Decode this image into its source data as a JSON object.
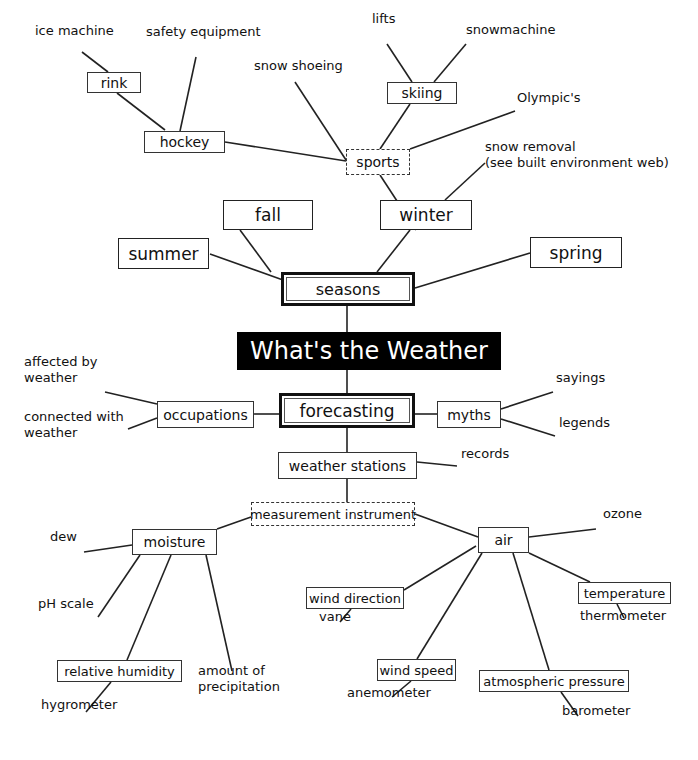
{
  "diagram": {
    "title": "What's the Weather",
    "colors": {
      "line": "#222222",
      "title_bg": "#000000",
      "title_fg": "#ffffff",
      "background": "#ffffff"
    },
    "nodes": [
      {
        "id": "title",
        "text": "What's the Weather",
        "style": "title",
        "x": 237,
        "y": 332,
        "w": 264,
        "h": 38,
        "fs": 24
      },
      {
        "id": "seasons",
        "text": "seasons",
        "style": "double-thick",
        "x": 281,
        "y": 272,
        "w": 134,
        "h": 34,
        "fs": 16
      },
      {
        "id": "forecasting",
        "text": "forecasting",
        "style": "double-thick",
        "x": 279,
        "y": 393,
        "w": 136,
        "h": 35,
        "fs": 17
      },
      {
        "id": "summer",
        "text": "summer",
        "style": "box-big",
        "x": 118,
        "y": 238,
        "w": 91,
        "h": 31,
        "fs": 17
      },
      {
        "id": "fall",
        "text": "fall",
        "style": "box-big",
        "x": 223,
        "y": 200,
        "w": 90,
        "h": 30,
        "fs": 17
      },
      {
        "id": "winter",
        "text": "winter",
        "style": "box-big",
        "x": 380,
        "y": 200,
        "w": 92,
        "h": 30,
        "fs": 17
      },
      {
        "id": "spring",
        "text": "spring",
        "style": "box-big",
        "x": 530,
        "y": 237,
        "w": 92,
        "h": 31,
        "fs": 17
      },
      {
        "id": "sports",
        "text": "sports",
        "style": "dashed",
        "x": 346,
        "y": 149,
        "w": 64,
        "h": 26,
        "fs": 14
      },
      {
        "id": "skiing",
        "text": "skiing",
        "style": "box",
        "x": 387,
        "y": 82,
        "w": 70,
        "h": 22,
        "fs": 14
      },
      {
        "id": "hockey",
        "text": "hockey",
        "style": "box",
        "x": 144,
        "y": 131,
        "w": 81,
        "h": 22,
        "fs": 14
      },
      {
        "id": "rink",
        "text": "rink",
        "style": "box",
        "x": 87,
        "y": 72,
        "w": 54,
        "h": 21,
        "fs": 14
      },
      {
        "id": "occupations",
        "text": "occupations",
        "style": "box",
        "x": 157,
        "y": 401,
        "w": 97,
        "h": 27,
        "fs": 14
      },
      {
        "id": "myths",
        "text": "myths",
        "style": "box",
        "x": 437,
        "y": 401,
        "w": 64,
        "h": 27,
        "fs": 14
      },
      {
        "id": "weather_stations",
        "text": "weather stations",
        "style": "box",
        "x": 278,
        "y": 452,
        "w": 139,
        "h": 27,
        "fs": 14
      },
      {
        "id": "measurement",
        "text": "measurement instrument",
        "style": "dashed",
        "x": 251,
        "y": 502,
        "w": 164,
        "h": 24,
        "fs": 13
      },
      {
        "id": "moisture",
        "text": "moisture",
        "style": "box",
        "x": 132,
        "y": 529,
        "w": 85,
        "h": 26,
        "fs": 14
      },
      {
        "id": "air",
        "text": "air",
        "style": "box",
        "x": 478,
        "y": 527,
        "w": 51,
        "h": 26,
        "fs": 14
      },
      {
        "id": "wind_direction",
        "text": "wind direction",
        "style": "box",
        "x": 306,
        "y": 587,
        "w": 98,
        "h": 22,
        "fs": 13
      },
      {
        "id": "temperature",
        "text": "temperature",
        "style": "box",
        "x": 578,
        "y": 582,
        "w": 93,
        "h": 22,
        "fs": 13
      },
      {
        "id": "relative_humidity",
        "text": "relative humidity",
        "style": "box",
        "x": 57,
        "y": 660,
        "w": 125,
        "h": 22,
        "fs": 13
      },
      {
        "id": "wind_speed",
        "text": "wind speed",
        "style": "box",
        "x": 377,
        "y": 659,
        "w": 79,
        "h": 22,
        "fs": 13
      },
      {
        "id": "atmospheric_pressure",
        "text": "atmospheric pressure",
        "style": "box",
        "x": 479,
        "y": 670,
        "w": 150,
        "h": 22,
        "fs": 13
      }
    ],
    "labels": [
      {
        "id": "ice_machine",
        "text": "ice machine",
        "x": 35,
        "y": 36,
        "fs": 13
      },
      {
        "id": "safety_equipment",
        "text": "safety equipment",
        "x": 146,
        "y": 37,
        "fs": 13
      },
      {
        "id": "lifts",
        "text": "lifts",
        "x": 372,
        "y": 24,
        "fs": 13
      },
      {
        "id": "snowmachine",
        "text": "snowmachine",
        "x": 466,
        "y": 35,
        "fs": 13
      },
      {
        "id": "snow_shoeing",
        "text": "snow shoeing",
        "x": 254,
        "y": 71,
        "fs": 13
      },
      {
        "id": "olympics",
        "text": "Olympic's",
        "x": 517,
        "y": 103,
        "fs": 13
      },
      {
        "id": "snow_removal",
        "text": "snow removal\n(see built environment web)",
        "x": 485,
        "y": 152,
        "fs": 13
      },
      {
        "id": "affected_by_weather",
        "text": "affected by\nweather",
        "x": 24,
        "y": 367,
        "fs": 13
      },
      {
        "id": "connected_with_weather",
        "text": "connected with\nweather",
        "x": 24,
        "y": 422,
        "fs": 13
      },
      {
        "id": "sayings",
        "text": "sayings",
        "x": 556,
        "y": 383,
        "fs": 13
      },
      {
        "id": "legends",
        "text": "legends",
        "x": 559,
        "y": 428,
        "fs": 13
      },
      {
        "id": "records",
        "text": "records",
        "x": 461,
        "y": 459,
        "fs": 13
      },
      {
        "id": "dew",
        "text": "dew",
        "x": 50,
        "y": 542,
        "fs": 13
      },
      {
        "id": "ozone",
        "text": "ozone",
        "x": 603,
        "y": 519,
        "fs": 13
      },
      {
        "id": "ph_scale",
        "text": "pH scale",
        "x": 38,
        "y": 609,
        "fs": 13
      },
      {
        "id": "vane",
        "text": "vane",
        "x": 319,
        "y": 622,
        "fs": 13
      },
      {
        "id": "thermometer",
        "text": "thermometer",
        "x": 580,
        "y": 621,
        "fs": 13
      },
      {
        "id": "amount_of_precipitation",
        "text": "amount of\nprecipitation",
        "x": 198,
        "y": 676,
        "fs": 13
      },
      {
        "id": "hygrometer",
        "text": "hygrometer",
        "x": 41,
        "y": 710,
        "fs": 13
      },
      {
        "id": "anemometer",
        "text": "anemometer",
        "x": 347,
        "y": 698,
        "fs": 13
      },
      {
        "id": "barometer",
        "text": "barometer",
        "x": 562,
        "y": 716,
        "fs": 13
      }
    ],
    "edges": [
      [
        347,
        306,
        347,
        332
      ],
      [
        347,
        370,
        347,
        393
      ],
      [
        283,
        280,
        210,
        254
      ],
      [
        271,
        272,
        240,
        230
      ],
      [
        377,
        272,
        410,
        230
      ],
      [
        415,
        288,
        530,
        253
      ],
      [
        416,
        230,
        380,
        175
      ],
      [
        445,
        200,
        485,
        163
      ],
      [
        380,
        149,
        410,
        104
      ],
      [
        412,
        82,
        387,
        44
      ],
      [
        434,
        82,
        466,
        44
      ],
      [
        410,
        149,
        515,
        111
      ],
      [
        346,
        160,
        295,
        82
      ],
      [
        346,
        161,
        225,
        142
      ],
      [
        180,
        131,
        196,
        57
      ],
      [
        165,
        130,
        117,
        93
      ],
      [
        108,
        72,
        82,
        52
      ],
      [
        254,
        414,
        279,
        414
      ],
      [
        157,
        404,
        105,
        392
      ],
      [
        157,
        418,
        128,
        429
      ],
      [
        415,
        414,
        437,
        414
      ],
      [
        501,
        409,
        553,
        392
      ],
      [
        501,
        419,
        555,
        436
      ],
      [
        347,
        428,
        347,
        452
      ],
      [
        417,
        462,
        457,
        466
      ],
      [
        347,
        479,
        347,
        502
      ],
      [
        251,
        517,
        217,
        529
      ],
      [
        415,
        514,
        478,
        537
      ],
      [
        132,
        545,
        84,
        552
      ],
      [
        140,
        555,
        98,
        617
      ],
      [
        171,
        555,
        127,
        660
      ],
      [
        206,
        555,
        232,
        671
      ],
      [
        111,
        682,
        86,
        712
      ],
      [
        529,
        537,
        596,
        529
      ],
      [
        476,
        546,
        404,
        590
      ],
      [
        482,
        553,
        417,
        659
      ],
      [
        513,
        553,
        549,
        670
      ],
      [
        529,
        553,
        590,
        582
      ],
      [
        351,
        609,
        340,
        622
      ],
      [
        411,
        681,
        392,
        697
      ],
      [
        561,
        692,
        578,
        716
      ],
      [
        617,
        604,
        624,
        618
      ]
    ]
  }
}
